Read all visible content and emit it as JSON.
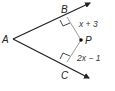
{
  "diagram": {
    "type": "angle-bisector-geometry",
    "points": {
      "A": {
        "label": "A",
        "x": 13,
        "y": 39
      },
      "B": {
        "label": "B",
        "x": 67,
        "y": 17
      },
      "C": {
        "label": "C",
        "x": 67,
        "y": 62
      },
      "P": {
        "label": "P",
        "x": 81,
        "y": 40
      }
    },
    "segments": [
      {
        "from": "B",
        "to": "P",
        "label": "x + 3",
        "perpendicular_to": "ray AB"
      },
      {
        "from": "C",
        "to": "P",
        "label": "2x − 1",
        "perpendicular_to": "ray AC"
      }
    ],
    "rays": [
      {
        "from": "A",
        "through": "B"
      },
      {
        "from": "A",
        "through": "C"
      }
    ],
    "labels": {
      "A": "A",
      "B": "B",
      "C": "C",
      "P": "P",
      "PB": "x + 3",
      "PC": "2x − 1"
    },
    "colors": {
      "ray": "#222222",
      "segment": "#9a9a9a",
      "point": "#111111"
    }
  }
}
